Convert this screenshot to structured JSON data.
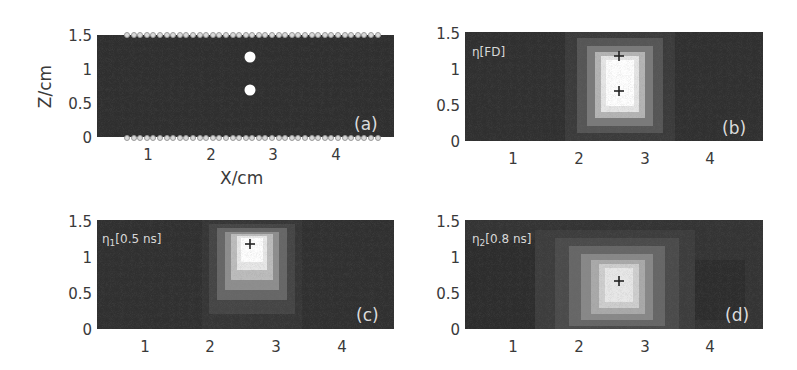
{
  "chart_data": [
    {
      "type": "heatmap",
      "panel": "(a)",
      "title": "",
      "xlabel": "X/cm",
      "ylabel": "Z/cm",
      "xlim": [
        0.2,
        4.9
      ],
      "ylim": [
        0,
        1.5
      ],
      "xticks": [
        "1",
        "2",
        "3",
        "4"
      ],
      "yticks": [
        "0",
        "0.5",
        "1",
        "1.5"
      ],
      "inclusions": [
        {
          "x": 2.6,
          "z": 1.2
        },
        {
          "x": 2.6,
          "z": 0.7
        }
      ],
      "annotation": "source/detector markers along top (z=1.5) and bottom (z=0) edges"
    },
    {
      "type": "heatmap",
      "panel": "(b)",
      "inset_label": "η[FD]",
      "xlim": [
        0.2,
        4.9
      ],
      "ylim": [
        0,
        1.5
      ],
      "xticks": [
        "1",
        "2",
        "3",
        "4"
      ],
      "yticks": [
        "0",
        "0.5",
        "1",
        "1.5"
      ],
      "peak_region": {
        "x": [
          2.4,
          2.9
        ],
        "z": [
          0.5,
          1.3
        ]
      },
      "crosses": [
        {
          "x": 2.6,
          "z": 1.2
        },
        {
          "x": 2.6,
          "z": 0.7
        }
      ]
    },
    {
      "type": "heatmap",
      "panel": "(c)",
      "inset_label": "η1[0.5 ns]",
      "xlim": [
        0.2,
        4.9
      ],
      "ylim": [
        0,
        1.5
      ],
      "xticks": [
        "1",
        "2",
        "3",
        "4"
      ],
      "yticks": [
        "0",
        "0.5",
        "1",
        "1.5"
      ],
      "peak_center": {
        "x": 2.6,
        "z": 1.2
      },
      "crosses": [
        {
          "x": 2.6,
          "z": 1.2
        }
      ]
    },
    {
      "type": "heatmap",
      "panel": "(d)",
      "inset_label": "η2[0.8 ns]",
      "xlim": [
        0.2,
        4.9
      ],
      "ylim": [
        0,
        1.5
      ],
      "xticks": [
        "1",
        "2",
        "3",
        "4"
      ],
      "yticks": [
        "0",
        "0.5",
        "1",
        "1.5"
      ],
      "peak_center": {
        "x": 2.6,
        "z": 0.7
      },
      "crosses": [
        {
          "x": 2.6,
          "z": 0.7
        }
      ]
    }
  ],
  "axes": {
    "xlabel": "X/cm",
    "ylabel": "Z/cm",
    "xticks": [
      "1",
      "2",
      "3",
      "4"
    ],
    "yticks": [
      "1.5",
      "1",
      "0.5",
      "0"
    ]
  },
  "panels": {
    "a": {
      "tag": "(a)"
    },
    "b": {
      "tag": "(b)",
      "inset_base": "η",
      "inset_sub": "",
      "inset_rest": "[FD]"
    },
    "c": {
      "tag": "(c)",
      "inset_base": "η",
      "inset_sub": "1",
      "inset_rest": "[0.5 ns]"
    },
    "d": {
      "tag": "(d)",
      "inset_base": "η",
      "inset_sub": "2",
      "inset_rest": "[0.8 ns]"
    }
  },
  "colors": {
    "background": "#2f2f2f",
    "highlight": "#ffffff",
    "text": "#3a3a3a"
  }
}
